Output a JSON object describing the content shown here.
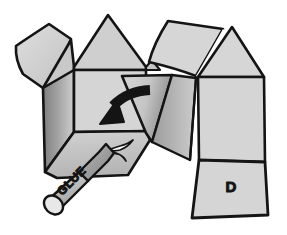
{
  "illustration": {
    "title": "Cardboard house model assembly step",
    "type": "line-art instructional diagram",
    "background_color": "#ffffff",
    "outline_color": "#141414",
    "labels": {
      "panel_d": "D",
      "glue_bottle": "GLUE"
    },
    "palette": {
      "paper_light": "#d8d8d8",
      "paper_mid": "#c9c9c9",
      "paper_shade": "#a9a9a9",
      "paper_dark": "#8f8f8f",
      "outline": "#141414",
      "arrow": "#141414",
      "glue_highlight": "#ffffff",
      "bottle_body": "#c0c0c0",
      "bottle_cap": "#9a9a9a"
    },
    "parts": [
      {
        "name": "top-left-flap",
        "fill": "paper_light",
        "description": "angled square flap upper left"
      },
      {
        "name": "left-gable-triangle",
        "fill": "paper_mid",
        "description": "small triangular gable left of center peak"
      },
      {
        "name": "center-gable-triangle",
        "fill": "paper_mid",
        "description": "large triangular roof gable at center"
      },
      {
        "name": "left-side-panel",
        "fill": "paper_dark",
        "description": "shaded left wall of the box"
      },
      {
        "name": "front-panel",
        "fill": "paper_light",
        "description": "front face of the box"
      },
      {
        "name": "bottom-flap",
        "fill": "paper_mid",
        "description": "lower flap receiving glue"
      },
      {
        "name": "folding-flap",
        "fill": "paper_shade",
        "description": "flap being folded, indicated by arrow"
      },
      {
        "name": "top-right-flap",
        "fill": "paper_light",
        "description": "upper right angled flap"
      },
      {
        "name": "right-gable-triangle",
        "fill": "paper_light",
        "description": "triangular gable at far right"
      },
      {
        "name": "right-side-panel",
        "fill": "paper_light",
        "description": "right wall of the box"
      },
      {
        "name": "panel-d",
        "fill": "paper_light",
        "description": "lower right panel labelled D"
      },
      {
        "name": "fold-arrow",
        "fill": "arrow",
        "description": "curved arrow pointing down-left showing fold direction"
      },
      {
        "name": "glue-bottle",
        "fill": "bottle_body",
        "description": "glue bottle with nozzle applying glue"
      },
      {
        "name": "glue-trail",
        "fill": "glue_highlight",
        "description": "white glue squiggle on the bottom flap"
      }
    ]
  }
}
